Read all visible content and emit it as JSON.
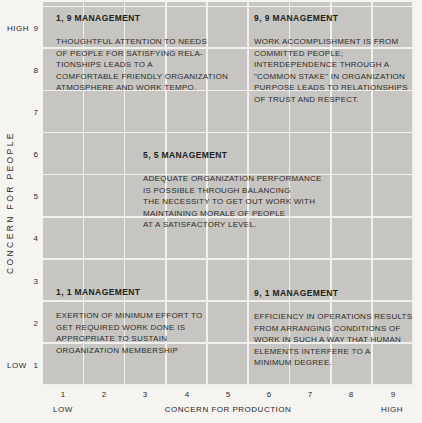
{
  "diagram": {
    "blocks": {
      "m19": {
        "heading": "1, 9 MANAGEMENT",
        "body": "THOUGHTFUL ATTENTION TO NEEDS\nOF PEOPLE FOR SATISFYING RELA-\nTIONSHIPS LEADS TO A\nCOMFORTABLE FRIENDLY ORGANIZATION\nATMOSPHERE AND WORK TEMPO."
      },
      "m99": {
        "heading": "9, 9 MANAGEMENT",
        "body": "WORK ACCOMPLISHMENT IS FROM\nCOMMITTED PEOPLE;\nINTERDEPENDENCE THROUGH A\n\"COMMON STAKE\" IN ORGANIZATION\nPURPOSE LEADS TO RELATIONSHIPS\nOF TRUST AND RESPECT."
      },
      "m55": {
        "heading": "5, 5 MANAGEMENT",
        "body": "ADEQUATE ORGANIZATION PERFORMANCE\nIS POSSIBLE THROUGH BALANCING\nTHE NECESSITY TO GET OUT WORK WITH\nMAINTAINING MORALE OF PEOPLE\nAT A SATISFACTORY LEVEL."
      },
      "m11": {
        "heading": "1, 1 MANAGEMENT",
        "body": "EXERTION OF MINIMUM EFFORT TO\nGET REQUIRED WORK DONE IS\nAPPROPRIATE TO SUSTAIN\nORGANIZATION MEMBERSHIP"
      },
      "m91": {
        "heading": "9, 1 MANAGEMENT",
        "body": "EFFICIENCY IN OPERATIONS RESULTS\nFROM ARRANGING CONDITIONS OF\nWORK IN SUCH A WAY THAT HUMAN\nELEMENTS INTERFERE TO A\nMINIMUM DEGREE."
      }
    },
    "y_axis": {
      "label": "CONCERN FOR PEOPLE",
      "high_label": "HIGH",
      "low_label": "LOW",
      "ticks": [
        "9",
        "8",
        "7",
        "6",
        "5",
        "4",
        "3",
        "2",
        "1"
      ]
    },
    "x_axis": {
      "label": "CONCERN FOR PRODUCTION",
      "low_label": "LOW",
      "high_label": "HIGH",
      "ticks": [
        "1",
        "2",
        "3",
        "4",
        "5",
        "6",
        "7",
        "8",
        "9"
      ]
    },
    "grid": {
      "rows": 9,
      "columns": 9
    },
    "colors": {
      "cell_gray": "#c7c5c2",
      "grid_line": "#f2f0ed",
      "background": "#f6f4f1",
      "text": "#2a2925"
    }
  }
}
